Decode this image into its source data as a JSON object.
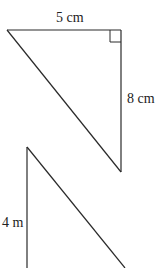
{
  "diagram": {
    "type": "geometry",
    "stroke_color": "#2a2a2a",
    "figures": [
      {
        "id": "triangle-1",
        "shape": "right-triangle",
        "vertices": [
          [
            7,
            30
          ],
          [
            121,
            30
          ],
          [
            121,
            172
          ]
        ],
        "right_angle_at": [
          121,
          30
        ],
        "labels": {
          "top": "5 cm",
          "right": "8 cm"
        }
      },
      {
        "id": "triangle-2",
        "shape": "right-triangle (partially visible)",
        "vertices": [
          [
            27,
            147
          ],
          [
            27,
            268
          ],
          [
            125,
            268
          ]
        ],
        "labels": {
          "left": "4 m"
        }
      }
    ]
  }
}
